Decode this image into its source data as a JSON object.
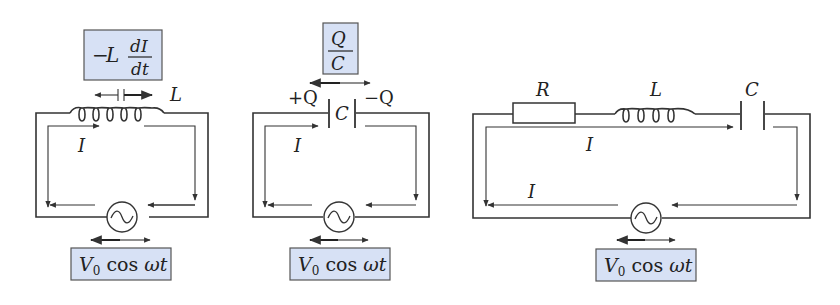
{
  "colors": {
    "label_box_fill": "#d7e1f5",
    "label_box_border": "#555555",
    "wire": "#333333",
    "background": "#ffffff"
  },
  "circuits": [
    {
      "id": "inductor-circuit",
      "component_label": "L",
      "voltage_box": {
        "prefix": "−L",
        "numerator": "dI",
        "denominator": "dt"
      },
      "current_label": "I",
      "source_label": {
        "v": "V",
        "sub": "0",
        "rest": " cos ",
        "omega_t": "ωt"
      }
    },
    {
      "id": "capacitor-circuit",
      "component_label": "C",
      "plus_charge": "+Q",
      "minus_charge": "−Q",
      "voltage_box": {
        "numerator": "Q",
        "denominator": "C"
      },
      "current_label": "I",
      "source_label": {
        "v": "V",
        "sub": "0",
        "rest": " cos ",
        "omega_t": "ωt"
      }
    },
    {
      "id": "rlc-circuit",
      "resistor_label": "R",
      "inductor_label": "L",
      "capacitor_label": "C",
      "current_label_top": "I",
      "current_label_bottom": "I",
      "source_label": {
        "v": "V",
        "sub": "0",
        "rest": " cos ",
        "omega_t": "ωt"
      }
    }
  ],
  "icons": {
    "ac_source": "sine-wave-in-circle",
    "inductor": "coil",
    "capacitor": "parallel-plates",
    "resistor": "rectangle"
  }
}
